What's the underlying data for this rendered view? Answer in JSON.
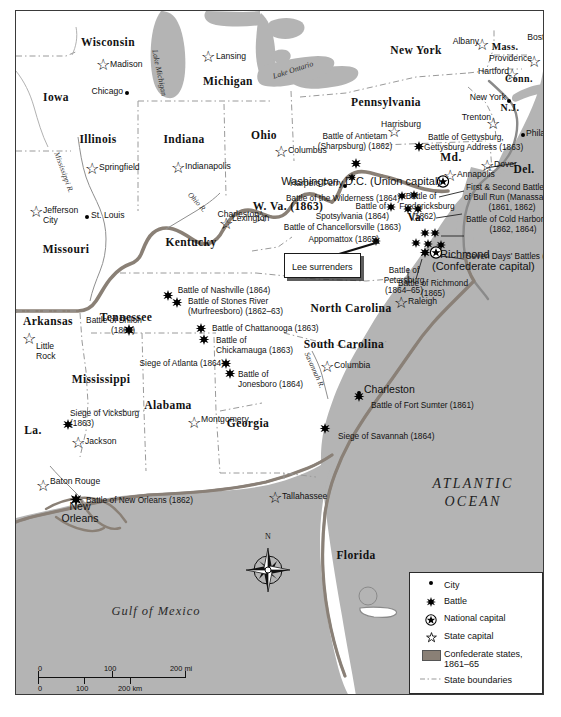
{
  "map": {
    "title": "American Civil War map of the eastern United States",
    "ocean_label": "ATLANTIC OCEAN",
    "ocean_line1": "ATLANTIC",
    "ocean_line2": "OCEAN",
    "gulf_label": "Gulf of Mexico",
    "colors": {
      "water": "#b4b4b4",
      "land": "#ffffff",
      "confederate_border": "#8a8076",
      "state_boundary": "#8c8c8c",
      "frame": "#3a3a3a",
      "text": "#111111"
    }
  },
  "states": [
    {
      "name": "Iowa",
      "x": 40,
      "y": 85
    },
    {
      "name": "Wisconsin",
      "x": 92,
      "y": 30
    },
    {
      "name": "Michigan",
      "x": 212,
      "y": 70
    },
    {
      "name": "Illinois",
      "x": 96,
      "y": 128
    },
    {
      "name": "Indiana",
      "x": 176,
      "y": 128
    },
    {
      "name": "Ohio",
      "x": 254,
      "y": 124
    },
    {
      "name": "New York",
      "x": 406,
      "y": 42
    },
    {
      "name": "Pennsylvania",
      "x": 375,
      "y": 92
    },
    {
      "name": "Missouri",
      "x": 50,
      "y": 238
    },
    {
      "name": "Kentucky",
      "x": 175,
      "y": 229
    },
    {
      "name": "Tennessee",
      "x": 112,
      "y": 307
    },
    {
      "name": "Arkansas",
      "x": 27,
      "y": 311
    },
    {
      "name": "Mississippi",
      "x": 88,
      "y": 368
    },
    {
      "name": "Alabama",
      "x": 155,
      "y": 393
    },
    {
      "name": "Georgia",
      "x": 234,
      "y": 412
    },
    {
      "name": "North Carolina",
      "x": 335,
      "y": 298
    },
    {
      "name": "South Carolina",
      "x": 330,
      "y": 334
    },
    {
      "name": "Florida",
      "x": 340,
      "y": 545
    },
    {
      "name": "La.",
      "x": 17,
      "y": 419
    },
    {
      "name": "W. Va. (1863)",
      "x": 273,
      "y": 195
    },
    {
      "name": "Va.",
      "x": 401,
      "y": 206
    },
    {
      "name": "Md.",
      "x": 435,
      "y": 146
    },
    {
      "name": "Del.",
      "x": 510,
      "y": 158
    },
    {
      "name": "N.J.",
      "x": 498,
      "y": 97
    },
    {
      "name": "Mass.",
      "x": 492,
      "y": 37
    },
    {
      "name": "Conn.",
      "x": 505,
      "y": 69
    },
    {
      "name": "R.I.",
      "x": 543,
      "y": 63
    }
  ],
  "water_bodies": [
    {
      "name": "Lake Michigan",
      "x": 160,
      "y": 60
    },
    {
      "name": "Lake Ontario",
      "x": 292,
      "y": 72
    }
  ],
  "rivers": [
    {
      "name": "Mississippi R.",
      "x": 50,
      "y": 162
    },
    {
      "name": "Ohio R.",
      "x": 181,
      "y": 192
    },
    {
      "name": "Savannah R.",
      "x": 305,
      "y": 355
    }
  ],
  "cities": [
    {
      "name": "Chicago",
      "x": 111,
      "y": 82,
      "type": "city"
    },
    {
      "name": "St. Louis",
      "x": 77,
      "y": 206,
      "type": "city"
    },
    {
      "name": "New York",
      "x": 489,
      "y": 88,
      "type": "city"
    },
    {
      "name": "Philadelphia",
      "x": 511,
      "y": 121,
      "type": "city"
    },
    {
      "name": "Boston",
      "x": 534,
      "y": 28,
      "type": "city"
    },
    {
      "name": "Harpers Ferry",
      "x": 327,
      "y": 172,
      "type": "city"
    },
    {
      "name": "Charleston",
      "x": 252,
      "y": 202,
      "type": "city"
    },
    {
      "name": "Lexington",
      "x": 218,
      "y": 209,
      "type": "city"
    },
    {
      "name": "Charleston",
      "x": 364,
      "y": 381,
      "type": "city"
    },
    {
      "name": "New Orleans",
      "x": 65,
      "y": 497,
      "type": "city"
    },
    {
      "name": "Richmond",
      "x": 432,
      "y": 244,
      "type": "city"
    }
  ],
  "state_capitals": [
    {
      "name": "Madison",
      "x": 96,
      "y": 53
    },
    {
      "name": "Lansing",
      "x": 203,
      "y": 45
    },
    {
      "name": "Springfield",
      "x": 92,
      "y": 153
    },
    {
      "name": "Indianapolis",
      "x": 176,
      "y": 152
    },
    {
      "name": "Columbus",
      "x": 281,
      "y": 138
    },
    {
      "name": "Jefferson City",
      "x": 29,
      "y": 200
    },
    {
      "name": "Albany",
      "x": 470,
      "y": 30
    },
    {
      "name": "Harrisburg",
      "x": 390,
      "y": 109
    },
    {
      "name": "Trenton",
      "x": 474,
      "y": 105
    },
    {
      "name": "Dover",
      "x": 484,
      "y": 152
    },
    {
      "name": "Annapolis",
      "x": 452,
      "y": 162
    },
    {
      "name": "Providence",
      "x": 520,
      "y": 47
    },
    {
      "name": "Hartford",
      "x": 500,
      "y": 60
    },
    {
      "name": "Raleigh",
      "x": 399,
      "y": 288
    },
    {
      "name": "Columbia",
      "x": 326,
      "y": 352
    },
    {
      "name": "Montgomery",
      "x": 187,
      "y": 406
    },
    {
      "name": "Jackson",
      "x": 72,
      "y": 428
    },
    {
      "name": "Baton Rouge",
      "x": 46,
      "y": 470
    },
    {
      "name": "Little Rock",
      "x": 17,
      "y": 336
    },
    {
      "name": "Tallahassee",
      "x": 272,
      "y": 483
    }
  ],
  "national_capitals": [
    {
      "name": "Washington, D.C. (Union capital)",
      "x": 432,
      "y": 170
    },
    {
      "name": "Richmond (Confederate capital)",
      "x": 432,
      "y": 244
    }
  ],
  "battles": [
    {
      "label": "Battle of Antietam (Sharpsburg) (1862)",
      "year": "1862"
    },
    {
      "label": "Battle of Gettysburg, Gettysburg Address (1863)",
      "year": "1863"
    },
    {
      "label": "Battle of the Wilderness (1864)",
      "year": "1864"
    },
    {
      "label": "Battle of Spotsylvania (1864)",
      "year": "1864"
    },
    {
      "label": "Battle of Chancellorsville (1863)",
      "year": "1863"
    },
    {
      "label": "Appomattox (1865)",
      "year": "1865"
    },
    {
      "label": "Battle of Fredericksburg (1862)",
      "year": "1862"
    },
    {
      "label": "First & Second Battles of Bull Run (Manassas) (1861, 1862)",
      "year": "1861, 1862"
    },
    {
      "label": "Battle of Cold Harbor (1862, 1864)",
      "year": "1862, 1864"
    },
    {
      "label": "Seven Days' Battles (1862)",
      "year": "1862"
    },
    {
      "label": "Battle of Petersburg (1864–65)",
      "year": "1864–65"
    },
    {
      "label": "Battle of Richmond (1865)",
      "year": "1865"
    },
    {
      "label": "Battle of Nashville (1864)",
      "year": "1864"
    },
    {
      "label": "Battle of Stones River (Murfreesboro) (1862–63)",
      "year": "1862–63"
    },
    {
      "label": "Battle of Shiloh (1862)",
      "year": "1862"
    },
    {
      "label": "Battle of Chattanooga (1863)",
      "year": "1863"
    },
    {
      "label": "Battle of Chickamauga (1863)",
      "year": "1863"
    },
    {
      "label": "Siege of Atlanta (1864)",
      "year": "1864"
    },
    {
      "label": "Battle of Jonesboro (1864)",
      "year": "1864"
    },
    {
      "label": "Siege of Vicksburg (1863)",
      "year": "1863"
    },
    {
      "label": "Battle of New Orleans (1862)",
      "year": "1862"
    },
    {
      "label": "Battle of Fort Sumter (1861)",
      "year": "1861"
    },
    {
      "label": "Siege of Savannah (1864)",
      "year": "1864"
    }
  ],
  "labels": {
    "antietam_l1": "Battle of Antietam",
    "antietam_l2": "(Sharpsburg) (1862)",
    "gettysburg_l1": "Battle of Gettysburg,",
    "gettysburg_l2": "Gettysburg Address (1863)",
    "harpers_ferry": "Harpers Ferry",
    "washington_dc": "Washington, D.C. (Union capital)",
    "wilderness": "Battle of the Wilderness (1864)",
    "wva": "W. Va. (1863)",
    "spotsylvania_l1": "Battle of",
    "spotsylvania_l2": "Spotsylvania (1864)",
    "chancellorsville": "Battle of Chancellorsville (1863)",
    "appomattox": "Appomattox (1865)",
    "fredericksburg_l1": "Battle of",
    "fredericksburg_l2": "Fredericksburg",
    "fredericksburg_l3": "(1862)",
    "bullrun_l1": "First & Second Battles",
    "bullrun_l2": "of Bull Run (Manassas)",
    "bullrun_l3": "(1861, 1862)",
    "coldharbor_l1": "Battle of Cold Harbor",
    "coldharbor_l2": "(1862, 1864)",
    "sevendays": "Seven Days' Battles (1862)",
    "richmond_l1": "Richmond",
    "richmond_l2": "(Confederate capital)",
    "petersburg_l1": "Battle of",
    "petersburg_l2": "Petersburg",
    "petersburg_l3": "(1864–65)",
    "richmond_battle_l1": "Battle of Richmond",
    "richmond_battle_l2": "(1865)",
    "lee_surrenders": "Lee surrenders",
    "nashville": "Battle of Nashville (1864)",
    "stonesriver_l1": "Battle of Stones River",
    "stonesriver_l2": "(Murfreesboro) (1862–63)",
    "shiloh_l1": "Battle of Shiloh",
    "shiloh_l2": "(1862)",
    "chattanooga": "Battle of Chattanooga (1863)",
    "chickamauga_l1": "Battle of",
    "chickamauga_l2": "Chickamauga (1863)",
    "atlanta": "Siege of Atlanta (1864)",
    "jonesboro_l1": "Battle of",
    "jonesboro_l2": "Jonesboro (1864)",
    "vicksburg_l1": "Siege of Vicksburg",
    "vicksburg_l2": "(1863)",
    "neworleans_battle": "Battle of New Orleans (1862)",
    "neworleans_l1": "New",
    "neworleans_l2": "Orleans",
    "fortsumter": "Battle of Fort Sumter (1861)",
    "savannah": "Siege of Savannah (1864)",
    "littlerock_l1": "Little",
    "littlerock_l2": "Rock",
    "jeffcity_l1": "Jefferson",
    "jeffcity_l2": "City"
  },
  "legend": {
    "items": [
      {
        "symbol": "city-dot",
        "label": "City"
      },
      {
        "symbol": "battle-star",
        "label": "Battle"
      },
      {
        "symbol": "national-capital",
        "label": "National capital"
      },
      {
        "symbol": "state-capital-star",
        "label": "State capital"
      },
      {
        "symbol": "confederate-swatch",
        "label": "Confederate states,\n1861–65",
        "label_l1": "Confederate states,",
        "label_l2": "1861–65"
      },
      {
        "symbol": "dashed-line",
        "label": "State boundaries"
      }
    ]
  },
  "scale": {
    "miles": {
      "t0": "0",
      "t1": "100",
      "t2": "200 mi"
    },
    "km": {
      "t0": "0",
      "t1": "100",
      "t2": "200 km"
    }
  },
  "compass": {
    "north": "N"
  }
}
